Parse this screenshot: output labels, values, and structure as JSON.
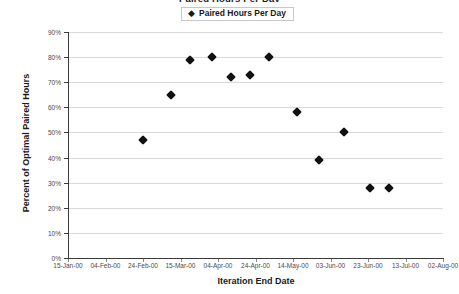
{
  "chart_data": {
    "type": "scatter",
    "title": "Paired Hours Per Day",
    "xlabel": "Iteration End Date",
    "ylabel": "Percent of Optimal Paired Hours",
    "legend": [
      {
        "label": "Paired Hours Per Day",
        "marker": "diamond",
        "color": "#111111"
      }
    ],
    "legend_position": "top-center",
    "grid": true,
    "ylim": [
      0,
      90
    ],
    "ytick_labels": [
      "90%",
      "80%",
      "70%",
      "60%",
      "50%",
      "40%",
      "30%",
      "20%",
      "10%",
      "0%"
    ],
    "ytick_values": [
      90,
      80,
      70,
      60,
      50,
      40,
      30,
      20,
      10,
      0
    ],
    "xtick_labels": [
      "15-Jan-00",
      "04-Feb-00",
      "24-Feb-00",
      "15-Mar-00",
      "04-Apr-00",
      "24-Apr-00",
      "14-May-00",
      "03-Jun-00",
      "23-Jun-00",
      "13-Jul-00",
      "02-Aug-00"
    ],
    "xlim_labels": [
      "15-Jan-00",
      "02-Aug-00"
    ],
    "series": [
      {
        "name": "Paired Hours Per Day",
        "x": [
          "24-Feb-00",
          "10-Mar-00",
          "20-Mar-00",
          "01-Apr-00",
          "11-Apr-00",
          "21-Apr-00",
          "01-May-00",
          "16-May-00",
          "28-May-00",
          "10-Jun-00",
          "24-Jun-00",
          "04-Jul-00"
        ],
        "values": [
          47,
          65,
          79,
          80,
          72,
          73,
          80,
          58,
          39,
          50,
          28,
          28
        ]
      }
    ]
  },
  "axis": {
    "y_title": "Percent of Optimal Paired Hours",
    "x_title": "Iteration End Date"
  },
  "legend": {
    "marker_glyph": "◆",
    "label": "Paired Hours Per Day"
  },
  "title": {
    "text": "Paired Hours Per Day"
  }
}
